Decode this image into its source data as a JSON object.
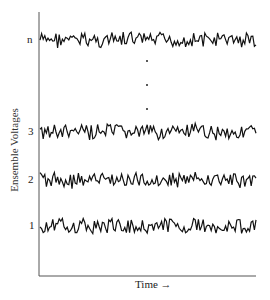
{
  "chart_data": {
    "type": "line",
    "title": "",
    "xlabel": "Time →",
    "ylabel": "Ensemble Voltages",
    "grid": false,
    "legend": null,
    "series": [
      {
        "name": "n",
        "label": "n",
        "baseline_y": 40,
        "description": "random noise voltage trace"
      },
      {
        "name": "3",
        "label": "3",
        "baseline_y": 132,
        "description": "random noise voltage trace"
      },
      {
        "name": "2",
        "label": "2",
        "baseline_y": 180,
        "description": "random noise voltage trace"
      },
      {
        "name": "1",
        "label": "1",
        "baseline_y": 226,
        "description": "random noise voltage trace"
      }
    ],
    "annotations": [
      "vertical ellipsis (three dots) between traces 3 and n"
    ],
    "axes": {
      "x_ticks": [],
      "y_ticks": [
        "1",
        "2",
        "3",
        "n"
      ]
    }
  },
  "labels": {
    "ylabel": "Ensemble Voltages",
    "xlabel": "Time →",
    "trace_n": "n",
    "trace_3": "3",
    "trace_2": "2",
    "trace_1": "1"
  },
  "colors": {
    "trace": "#111111",
    "axis": "#444444",
    "background": "#ffffff"
  }
}
